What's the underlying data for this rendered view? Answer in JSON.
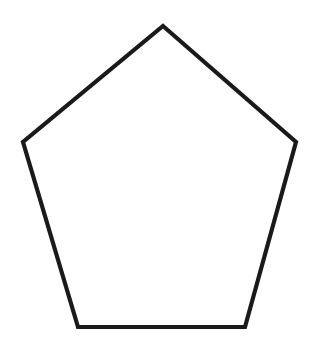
{
  "canvas": {
    "width": 315,
    "height": 341,
    "background_color": "#ffffff",
    "figure_name": "pentagon"
  },
  "shape": {
    "name": "pentagon",
    "sides": 5,
    "label": "Pentagon",
    "fill_color": "none",
    "fill_label": "unfilled",
    "stroke_color": "#1a1a1a",
    "stroke_width": 4.2,
    "closed": true,
    "orientation": "point-up",
    "vertices": [
      {
        "name": "apex",
        "x": 163,
        "y": 26
      },
      {
        "name": "right-upper",
        "x": 296,
        "y": 142
      },
      {
        "name": "bottom-right",
        "x": 245,
        "y": 327
      },
      {
        "name": "bottom-left",
        "x": 78,
        "y": 327
      },
      {
        "name": "left-upper",
        "x": 23,
        "y": 142
      }
    ],
    "points_attr": "163,26 296,142 245,327 78,327 23,142",
    "center": {
      "x": 161,
      "y": 183
    }
  }
}
